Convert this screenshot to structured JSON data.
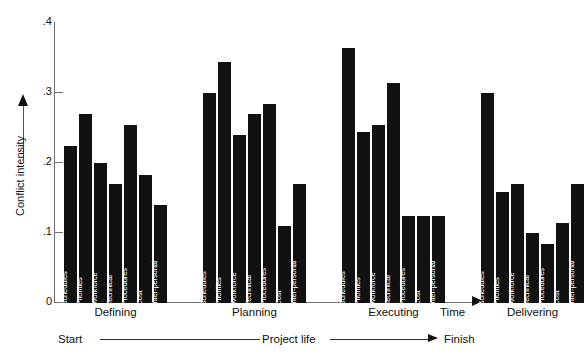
{
  "chart_data": {
    "type": "bar",
    "title": "",
    "xlabel": "Time",
    "ylabel": "Conflict intensity",
    "ylim": [
      0,
      0.4
    ],
    "ytick_labels": [
      ".4",
      ".3",
      ".2",
      ".1",
      "0"
    ],
    "ytick_values": [
      0.4,
      0.3,
      0.2,
      0.1,
      0.0
    ],
    "grid": false,
    "legend": "none",
    "categories": [
      "Schedules",
      "Priorities",
      "Workforce",
      "Technical",
      "Procedures",
      "Cost",
      "Inter-personal"
    ],
    "groups": [
      "Defining",
      "Planning",
      "Executing",
      "Delivering"
    ],
    "series": [
      {
        "name": "Defining",
        "values": [
          0.225,
          0.27,
          0.2,
          0.17,
          0.255,
          0.183,
          0.14
        ]
      },
      {
        "name": "Planning",
        "values": [
          0.3,
          0.345,
          0.24,
          0.27,
          0.285,
          0.11,
          0.17
        ]
      },
      {
        "name": "Executing",
        "values": [
          0.365,
          0.245,
          0.255,
          0.315,
          0.125,
          0.125,
          0.125
        ]
      },
      {
        "name": "Delivering",
        "values": [
          0.3,
          0.158,
          0.17,
          0.1,
          0.085,
          0.115,
          0.17
        ]
      }
    ],
    "annotations": {
      "start": "Start",
      "middle": "Project life",
      "finish": "Finish"
    },
    "colors": {
      "bar": "#111111",
      "axis": "#6f6f6f",
      "text": "#111111",
      "bar_label": "#ffffff",
      "background": "#ffffff"
    }
  }
}
